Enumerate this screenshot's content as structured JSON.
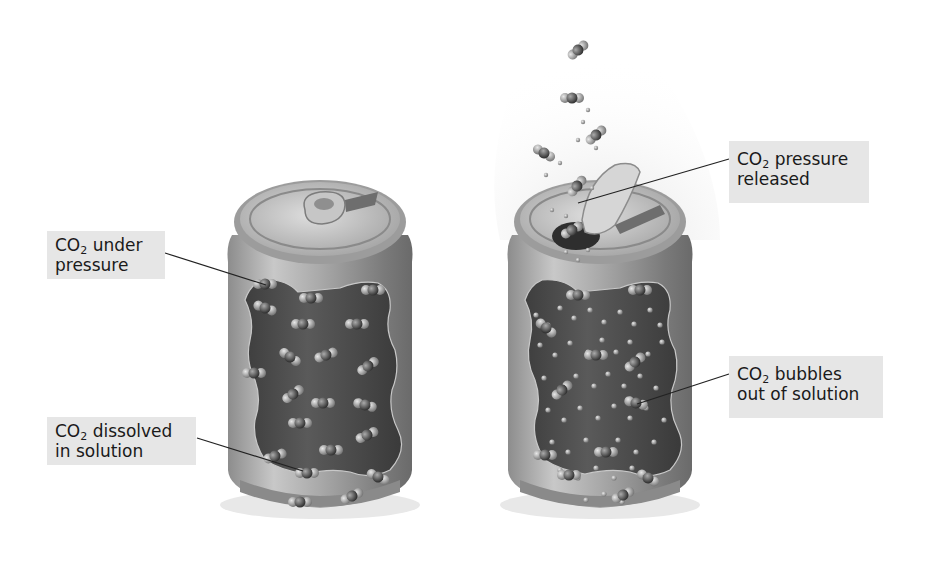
{
  "figure": {
    "panels": [
      {
        "id": "closed-can",
        "description": "Sealed can, CO2 molecules dissolved in solution"
      },
      {
        "id": "open-can",
        "description": "Opened can, CO2 bubbles escaping out of solution"
      }
    ],
    "labels": {
      "under_pressure": {
        "line1_prefix": "CO",
        "subscript": "2",
        "line1_suffix": " under",
        "line2": "pressure"
      },
      "dissolved": {
        "line1_prefix": "CO",
        "subscript": "2",
        "line1_suffix": " dissolved",
        "line2": "in solution"
      },
      "pressure_released": {
        "line1_prefix": "CO",
        "subscript": "2",
        "line1_suffix": " pressure",
        "line2": "released"
      },
      "bubbles_out": {
        "line1_prefix": "CO",
        "subscript": "2",
        "line1_suffix": " bubbles",
        "line2": "out of solution"
      }
    },
    "colors": {
      "label_bg": "#e6e6e6",
      "can_body": "#9a9a9a",
      "liquid": "#4d4d4d",
      "molecule": "#b5b5b5",
      "leader_line": "#222222"
    }
  }
}
